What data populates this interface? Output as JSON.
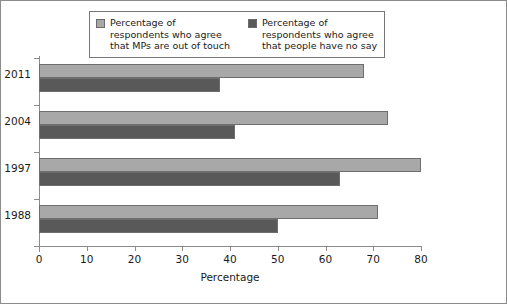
{
  "chart_data": {
    "type": "bar",
    "orientation": "horizontal",
    "title": "",
    "xlabel": "Percentage",
    "ylabel": "",
    "xlim": [
      0,
      80
    ],
    "xticks": [
      0,
      10,
      20,
      30,
      40,
      50,
      60,
      70,
      80
    ],
    "grid": false,
    "legend_position": "top",
    "categories": [
      "2011",
      "2004",
      "1997",
      "1988"
    ],
    "series": [
      {
        "name": "Percentage of\nrespondents who agree\nthat MPs are out of touch",
        "color": "#a8a8a8",
        "values": [
          68,
          73,
          80,
          71
        ]
      },
      {
        "name": "Percentage of\nrespondents who agree\nthat people have no say",
        "color": "#595959",
        "values": [
          38,
          41,
          63,
          50
        ]
      }
    ]
  },
  "axis": {
    "x_title": "Percentage",
    "tick_labels": [
      "0",
      "10",
      "20",
      "30",
      "40",
      "50",
      "60",
      "70",
      "80"
    ],
    "category_labels": [
      "2011",
      "2004",
      "1997",
      "1988"
    ]
  },
  "legend": {
    "entries": [
      {
        "label": "Percentage of\nrespondents who agree\nthat MPs are out of touch",
        "color": "#a8a8a8"
      },
      {
        "label": "Percentage of\nrespondents who agree\nthat people have no say",
        "color": "#595959"
      }
    ]
  },
  "colors": {
    "series_light": "#a8a8a8",
    "series_dark": "#595959",
    "axis": "#8c8c8c",
    "border": "#8c8c8c",
    "text": "#1a1a1a"
  }
}
